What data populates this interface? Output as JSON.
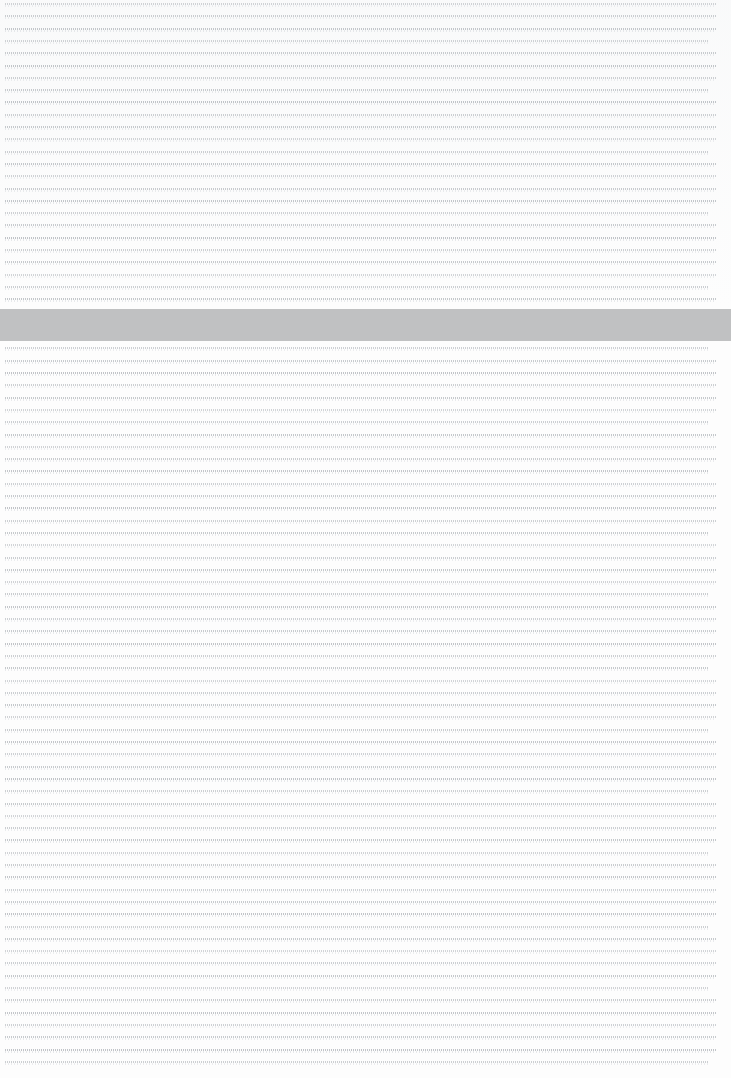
{
  "page": {
    "width": 731,
    "height": 1078,
    "background_color": "#fdfdfd",
    "zoom_state": "fit-page"
  },
  "body_text": {
    "label": "Document body text",
    "legible": false,
    "rendered_as": "greeked-lines",
    "line_color": "#969ca3",
    "line_count": 87,
    "line_pitch_px": 12.3,
    "first_line_y": 3,
    "left_margin_px": 5,
    "right_margin_px": 8,
    "alignment": "justified",
    "line_widths_pct": [
      99,
      99,
      99,
      98,
      99,
      99,
      99,
      98,
      99,
      99,
      99,
      99,
      98,
      99,
      99,
      99,
      99,
      98,
      99,
      99,
      99,
      99,
      99,
      98,
      99,
      99,
      99,
      99,
      98,
      99,
      99,
      99,
      99,
      99,
      98,
      99,
      99,
      99,
      98,
      99,
      99,
      99,
      99,
      98,
      99,
      99,
      99,
      99,
      98,
      99,
      99,
      99,
      99,
      99,
      98,
      99,
      99,
      99,
      99,
      98,
      99,
      99,
      99,
      99,
      98,
      99,
      99,
      99,
      99,
      98,
      99,
      99,
      99,
      99,
      99,
      98,
      99,
      99,
      99,
      99,
      98,
      99,
      99,
      99,
      99,
      99,
      98
    ]
  },
  "selection_band": {
    "label": "Highlighted text band",
    "color": "#c0c1c2",
    "x": 0,
    "y": 309,
    "width": 731,
    "height": 32
  }
}
